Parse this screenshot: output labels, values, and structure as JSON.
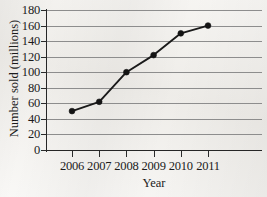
{
  "chart_data": {
    "type": "line",
    "title": "",
    "xlabel": "Year",
    "ylabel": "Number sold (millions)",
    "categories": [
      "2006",
      "2007",
      "2008",
      "2009",
      "2010",
      "2011"
    ],
    "values": [
      50,
      62,
      100,
      122,
      150,
      160
    ],
    "series": [
      {
        "name": "Number sold",
        "values": [
          50,
          62,
          100,
          122,
          150,
          160
        ]
      }
    ],
    "ylim": [
      0,
      180
    ],
    "y_ticks": [
      0,
      20,
      40,
      60,
      80,
      100,
      120,
      140,
      160,
      180
    ],
    "y_tick_labels": [
      "0",
      "20",
      "40",
      "60",
      "80",
      "100",
      "120",
      "140",
      "160",
      "180"
    ],
    "x_ticks": [
      "2006",
      "2007",
      "2008",
      "2009",
      "2010",
      "2011"
    ],
    "grid": "horizontal",
    "legend": "none",
    "marker": "filled-circle",
    "line_color": "#1a1a1a",
    "marker_color": "#141414",
    "grid_color": "#8d8d8d",
    "axis_color": "#262626",
    "background_color": "#f3f1ed"
  }
}
